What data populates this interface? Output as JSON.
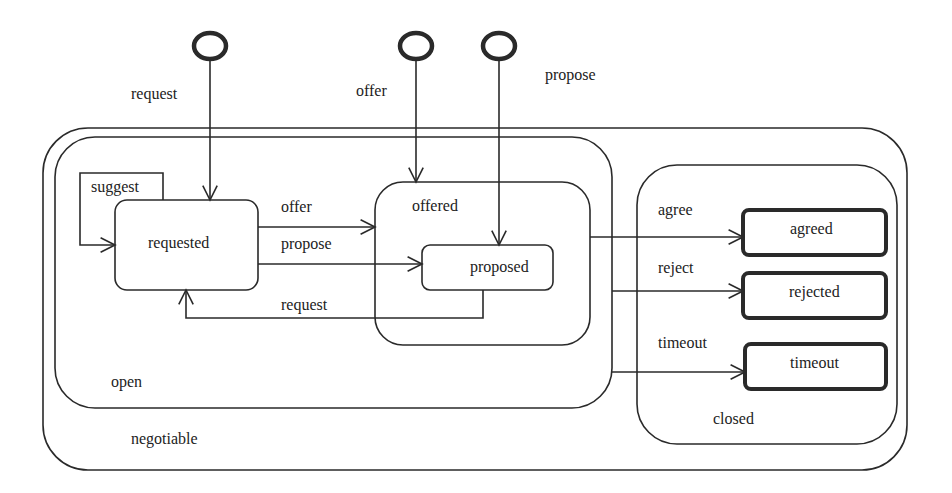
{
  "diagram": {
    "type": "statechart",
    "initial_transitions": [
      {
        "label": "request",
        "target": "requested"
      },
      {
        "label": "offer",
        "target": "offered"
      },
      {
        "label": "propose",
        "target": "proposed"
      }
    ],
    "composite_states": {
      "negotiable": "negotiable",
      "open": "open",
      "offered": "offered",
      "closed": "closed"
    },
    "states": {
      "requested": "requested",
      "proposed": "proposed",
      "agreed": "agreed",
      "rejected": "rejected",
      "timeout": "timeout"
    },
    "transitions": {
      "suggest": "suggest",
      "offer": "offer",
      "propose": "propose",
      "request_back": "request",
      "agree": "agree",
      "reject": "reject",
      "timeout": "timeout"
    }
  },
  "colors": {
    "stroke": "#2a2a2a",
    "background": "#ffffff"
  }
}
